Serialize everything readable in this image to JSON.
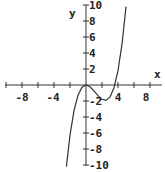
{
  "chart_data": {
    "type": "line",
    "title": "",
    "xlabel": "x",
    "ylabel": "y",
    "xlim": [
      -10,
      10
    ],
    "ylim": [
      -10,
      10
    ],
    "grid": false,
    "x_tick_labels": [
      "-8",
      "-4",
      "4",
      "8"
    ],
    "y_tick_labels": [
      "10",
      "8",
      "6",
      "4",
      "2",
      "-2",
      "-4",
      "-6",
      "-8",
      "-10"
    ],
    "series": [
      {
        "name": "cubic curve",
        "x": [
          -2.45,
          -2,
          -1.5,
          -1,
          -0.5,
          0,
          0.5,
          1,
          1.5,
          2,
          2.5,
          3,
          3.5,
          4,
          4.5,
          5
        ],
        "y": [
          -10.2,
          -6.27,
          -3.2,
          -1.29,
          -0.29,
          0,
          -0.22,
          -0.73,
          -1.32,
          -1.79,
          -1.93,
          -1.51,
          -0.34,
          1.79,
          5.1,
          9.8
        ]
      }
    ],
    "color": "#333333"
  }
}
